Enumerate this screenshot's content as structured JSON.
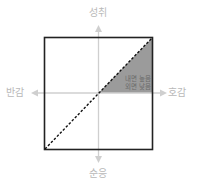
{
  "diagram": {
    "axes": {
      "top": "성취",
      "bottom": "순응",
      "left": "반감",
      "right": "호감"
    },
    "shaded_region": {
      "line1": "내면 높음",
      "line2": "외면 낮음"
    },
    "colors": {
      "frame": "#222222",
      "axis": "#c8c8c8",
      "label": "#b9b9b9",
      "shade": "#999999",
      "diagonal": "#111111"
    }
  }
}
